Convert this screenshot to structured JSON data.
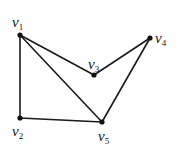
{
  "graph": {
    "nodes": [
      {
        "id": "v1",
        "label": "v",
        "sub": "1",
        "x": 20,
        "y": 35,
        "lx": 12,
        "ly": 27
      },
      {
        "id": "v2",
        "label": "v",
        "sub": "2",
        "x": 20,
        "y": 118,
        "lx": 12,
        "ly": 136
      },
      {
        "id": "v3",
        "label": "v",
        "sub": "3",
        "x": 94,
        "y": 75,
        "lx": 88,
        "ly": 69
      },
      {
        "id": "v4",
        "label": "v",
        "sub": "4",
        "x": 150,
        "y": 38,
        "lx": 155,
        "ly": 43
      },
      {
        "id": "v5",
        "label": "v",
        "sub": "5",
        "x": 102,
        "y": 122,
        "lx": 98,
        "ly": 141
      }
    ],
    "edges": [
      {
        "from": "v1",
        "to": "v2"
      },
      {
        "from": "v1",
        "to": "v3"
      },
      {
        "from": "v1",
        "to": "v5"
      },
      {
        "from": "v2",
        "to": "v5"
      },
      {
        "from": "v3",
        "to": "v4"
      },
      {
        "from": "v4",
        "to": "v5"
      }
    ]
  }
}
